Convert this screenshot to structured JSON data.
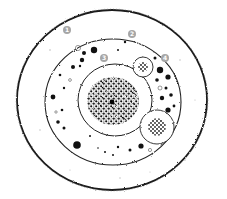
{
  "diagram": {
    "type": "cell-illustration",
    "colors": {
      "background": "#ffffff",
      "outline": "#1a1a1a",
      "label_fill": "#a6a6a6",
      "label_text": "#ffffff",
      "granule": "#111111"
    },
    "structures": [
      {
        "id": "outer-layer",
        "shape": "ellipse",
        "cx": 112,
        "cy": 100,
        "rx": 95,
        "ry": 90
      },
      {
        "id": "cell-membrane",
        "shape": "ellipse",
        "cx": 113,
        "cy": 102,
        "rx": 68,
        "ry": 63
      },
      {
        "id": "nucleus",
        "shape": "ellipse",
        "cx": 115,
        "cy": 100,
        "rx": 37,
        "ry": 36
      },
      {
        "id": "vesicle-small",
        "shape": "circle",
        "cx": 143,
        "cy": 67,
        "r": 10
      },
      {
        "id": "vesicle-large",
        "shape": "circle",
        "cx": 157,
        "cy": 127,
        "r": 17
      }
    ],
    "labels": [
      {
        "id": "label-1",
        "text": "1",
        "x": 67,
        "y": 30
      },
      {
        "id": "label-2",
        "text": "2",
        "x": 132,
        "y": 34
      },
      {
        "id": "label-3",
        "text": "3",
        "x": 104,
        "y": 58
      },
      {
        "id": "label-4",
        "text": "4",
        "x": 165,
        "y": 58
      }
    ]
  }
}
